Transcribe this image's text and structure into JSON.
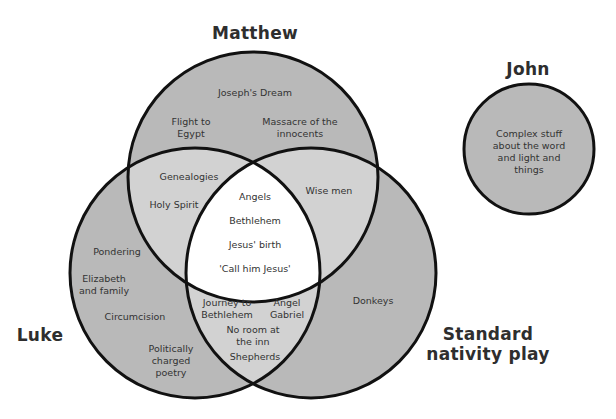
{
  "colors": {
    "single_region": "#b9b9b9",
    "double_overlap": "#d2d2d2",
    "triple_overlap": "#ffffff",
    "outline": "#111111",
    "text": "#333333"
  },
  "sets": {
    "matthew": {
      "label": "Matthew"
    },
    "luke": {
      "label": "Luke"
    },
    "standard": {
      "label": "Standard\nnativity play"
    },
    "john": {
      "label": "John"
    }
  },
  "regions": {
    "matthew_only": [
      "Joseph's Dream",
      "Flight to\nEgypt",
      "Massacre of the\ninnocents"
    ],
    "matthew_luke": [
      "Genealogies",
      "Holy Spirit"
    ],
    "matthew_standard": [
      "Wise men"
    ],
    "all_three": [
      "Angels",
      "Bethlehem",
      "Jesus' birth",
      "'Call him Jesus'"
    ],
    "luke_only": [
      "Pondering",
      "Elizabeth\nand family",
      "Circumcision",
      "Politically\ncharged\npoetry"
    ],
    "luke_standard": [
      "Journey to\nBethlehem",
      "Angel\nGabriel",
      "No room at\nthe inn",
      "Shepherds"
    ],
    "standard_only": [
      "Donkeys"
    ],
    "john_only": [
      "Complex stuff\nabout the word\nand light and\nthings"
    ]
  }
}
